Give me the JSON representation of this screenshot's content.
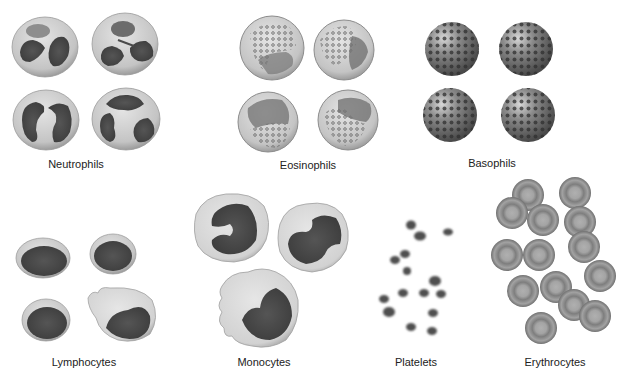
{
  "figure": {
    "background": "#ffffff",
    "groups": [
      {
        "id": "neutrophils",
        "label": "Neutrophils",
        "label_pos": [
          76,
          165
        ],
        "count": 4
      },
      {
        "id": "eosinophils",
        "label": "Eosinophils",
        "label_pos": [
          308,
          166
        ],
        "count": 4
      },
      {
        "id": "basophils",
        "label": "Basophils",
        "label_pos": [
          492,
          164
        ],
        "count": 4
      },
      {
        "id": "lymphocytes",
        "label": "Lymphocytes",
        "label_pos": [
          84,
          363
        ],
        "count": 4
      },
      {
        "id": "monocytes",
        "label": "Monocytes",
        "label_pos": [
          264,
          363
        ],
        "count": 3
      },
      {
        "id": "platelets",
        "label": "Platelets",
        "label_pos": [
          416,
          363
        ],
        "count": 15
      },
      {
        "id": "erythrocytes",
        "label": "Erythrocytes",
        "label_pos": [
          555,
          363
        ],
        "count": 14
      }
    ],
    "colors": {
      "cytoplasm": "#c9c9c9",
      "cytoplasm_edge": "#9a9a9a",
      "nucleus": "#4a4a4a",
      "eosinophil_granule": "#7b7b7b",
      "basophil_body": "#6b6b6b",
      "basophil_granule": "#333333",
      "monocyte_cytoplasm": "#d6d6d6",
      "platelet": "#555555",
      "erythrocyte": "#8f8f8f",
      "erythrocyte_center": "#a9a9a9",
      "label_text": "#222222"
    }
  }
}
